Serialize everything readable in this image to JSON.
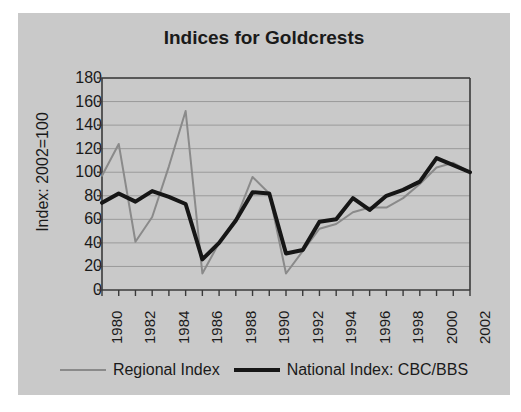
{
  "chart_data": {
    "type": "line",
    "title": "Indices for Goldcrests",
    "xlabel": "",
    "ylabel": "Index: 2002=100",
    "x": [
      1980,
      1981,
      1982,
      1983,
      1984,
      1985,
      1986,
      1987,
      1988,
      1989,
      1990,
      1991,
      1992,
      1993,
      1994,
      1995,
      1996,
      1997,
      1998,
      1999,
      2000,
      2001,
      2002
    ],
    "xlim": [
      1980,
      2002
    ],
    "ylim": [
      0,
      180
    ],
    "yticks": [
      0,
      20,
      40,
      60,
      80,
      100,
      120,
      140,
      160,
      180
    ],
    "xticks": [
      1980,
      1982,
      1984,
      1986,
      1988,
      1990,
      1992,
      1994,
      1996,
      1998,
      2000,
      2002
    ],
    "xtick_labels": [
      "1980",
      "1982",
      "1984",
      "1986",
      "1988",
      "1990",
      "1992",
      "1994",
      "1996",
      "1998",
      "2000",
      "2002"
    ],
    "ytick_labels": [
      "0",
      "20",
      "40",
      "60",
      "80",
      "100",
      "120",
      "140",
      "160",
      "180"
    ],
    "grid": true,
    "grid_axis": "y",
    "legend_position": "bottom",
    "series": [
      {
        "name": "Regional Index",
        "color": "#8a8a8a",
        "width": 2,
        "values": [
          97,
          124,
          41,
          62,
          105,
          152,
          14,
          40,
          60,
          96,
          82,
          14,
          33,
          52,
          56,
          66,
          70,
          70,
          78,
          90,
          104,
          108,
          100
        ]
      },
      {
        "name": "National Index: CBC/BBS",
        "color": "#161616",
        "width": 4,
        "values": [
          74,
          82,
          75,
          84,
          79,
          73,
          26,
          40,
          59,
          83,
          82,
          31,
          34,
          58,
          60,
          78,
          68,
          80,
          85,
          92,
          112,
          106,
          100
        ]
      }
    ]
  },
  "legend": {
    "items": [
      {
        "label": "Regional Index",
        "color": "#8a8a8a"
      },
      {
        "label": "National Index: CBC/BBS",
        "color": "#161616"
      }
    ]
  },
  "colors": {
    "panel_background": "#c9c9c9",
    "page_background": "#ffffff",
    "axis": "#3a3a3a",
    "grid": "#9a9a9a",
    "text": "#1a1a1a"
  }
}
